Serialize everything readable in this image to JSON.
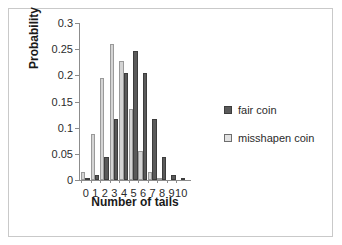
{
  "chart_data": {
    "type": "bar",
    "title": "",
    "xlabel": "Number of tails",
    "ylabel": "Probability",
    "categories": [
      "0",
      "1",
      "2",
      "3",
      "4",
      "5",
      "6",
      "7",
      "8",
      "9",
      "10"
    ],
    "ylim": [
      0,
      0.3
    ],
    "ytick_labels": [
      "0",
      "0.05",
      "0.1",
      "0.15",
      "0.2",
      "0.25",
      "0.3"
    ],
    "ytick_values": [
      0,
      0.05,
      0.1,
      0.15,
      0.2,
      0.25,
      0.3
    ],
    "grid": false,
    "legend_position": "right",
    "series": [
      {
        "name": "fair coin",
        "color": "#5a5a5a",
        "values": [
          0.001,
          0.01,
          0.044,
          0.117,
          0.205,
          0.246,
          0.205,
          0.117,
          0.044,
          0.01,
          0.001
        ]
      },
      {
        "name": "misshapen coin",
        "color": "#d4d4d4",
        "values": [
          0.016,
          0.087,
          0.195,
          0.26,
          0.228,
          0.136,
          0.056,
          0.015,
          0.002,
          0.0,
          0.0
        ]
      }
    ]
  },
  "legend": {
    "items": [
      {
        "label": "fair coin",
        "swatch": "fair"
      },
      {
        "label": "misshapen coin",
        "swatch": "misshapen"
      }
    ]
  },
  "colors": {
    "fair_bar": "#5a5a5a",
    "misshapen_bar": "#d4d4d4",
    "axis": "#8c8c8c",
    "frame": "#c9c9c9",
    "text": "#1a1a1a"
  }
}
